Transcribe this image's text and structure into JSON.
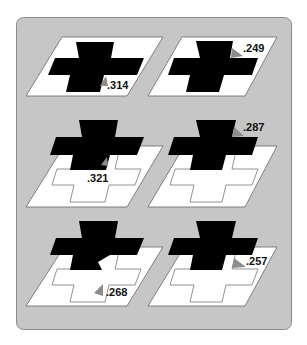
{
  "figure": {
    "background": "#ffffff",
    "frame_color": "#c8c8c8",
    "frame_border": "#8a8a8a",
    "panel_fill": "#ffffff",
    "panel_stroke": "#555555",
    "cross_fill": "#000000",
    "outline_stroke": "#777777",
    "marker_fill": "#8c8c8c"
  },
  "panels": [
    {
      "id": "top-left",
      "label": ".314",
      "layout": "flat"
    },
    {
      "id": "top-right",
      "label": ".249",
      "layout": "flat"
    },
    {
      "id": "middle-left",
      "label": ".321",
      "layout": "raised"
    },
    {
      "id": "middle-right",
      "label": ".287",
      "layout": "raised"
    },
    {
      "id": "bottom-left",
      "label": ".268",
      "layout": "raised-notched"
    },
    {
      "id": "bottom-right",
      "label": ".257",
      "layout": "raised"
    }
  ]
}
